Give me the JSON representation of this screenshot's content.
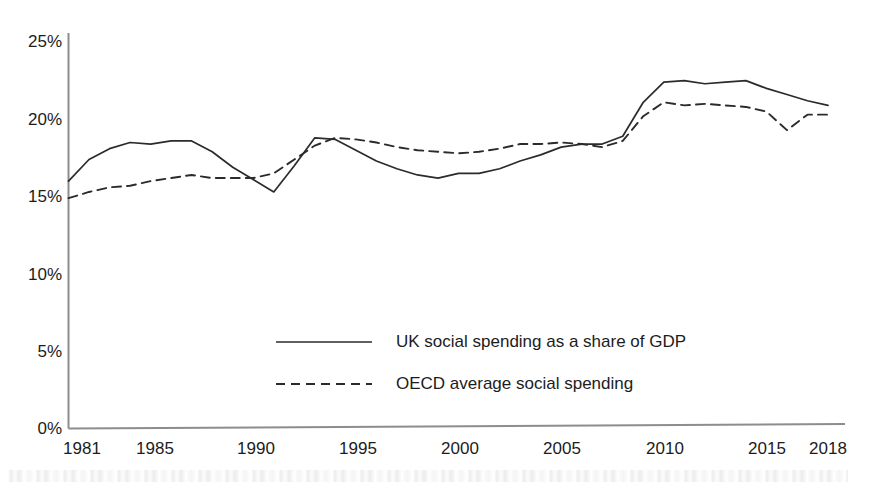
{
  "chart_data": {
    "type": "line",
    "title": "",
    "subtitle": "",
    "xlabel": "",
    "ylabel": "",
    "xlim": [
      1981,
      2018
    ],
    "ylim": [
      0,
      25
    ],
    "grid": false,
    "legend_position": "center",
    "y_ticks": [
      "0%",
      "5%",
      "10%",
      "15%",
      "20%",
      "25%"
    ],
    "y_tick_values": [
      0,
      5,
      10,
      15,
      20,
      25
    ],
    "x_ticks": [
      "1981",
      "1985",
      "1990",
      "1995",
      "2000",
      "2005",
      "2010",
      "2015",
      "2018"
    ],
    "x_tick_values": [
      1981,
      1985,
      1990,
      1995,
      2000,
      2005,
      2010,
      2015,
      2018
    ],
    "x": [
      1981,
      1982,
      1983,
      1984,
      1985,
      1986,
      1987,
      1988,
      1989,
      1990,
      1991,
      1992,
      1993,
      1994,
      1995,
      1996,
      1997,
      1998,
      1999,
      2000,
      2001,
      2002,
      2003,
      2004,
      2005,
      2006,
      2007,
      2008,
      2009,
      2010,
      2011,
      2012,
      2013,
      2014,
      2015,
      2016,
      2017,
      2018
    ],
    "series": [
      {
        "name": "UK social spending as a share of GDP",
        "style": "solid",
        "color": "#2b2b2b",
        "values": [
          16.0,
          17.4,
          18.1,
          18.5,
          18.4,
          18.6,
          18.6,
          17.9,
          16.9,
          16.1,
          15.3,
          17.0,
          18.8,
          18.7,
          18.0,
          17.3,
          16.8,
          16.4,
          16.2,
          16.5,
          16.5,
          16.8,
          17.3,
          17.7,
          18.2,
          18.4,
          18.4,
          18.9,
          21.1,
          22.4,
          22.5,
          22.3,
          22.4,
          22.5,
          22.0,
          21.6,
          21.2,
          20.9
        ]
      },
      {
        "name": "OECD average social spending",
        "style": "dashed",
        "color": "#2b2b2b",
        "values": [
          14.9,
          15.3,
          15.6,
          15.7,
          16.0,
          16.2,
          16.4,
          16.2,
          16.2,
          16.2,
          16.5,
          17.4,
          18.3,
          18.8,
          18.7,
          18.5,
          18.2,
          18.0,
          17.9,
          17.8,
          17.9,
          18.1,
          18.4,
          18.4,
          18.5,
          18.4,
          18.2,
          18.6,
          20.2,
          21.1,
          20.9,
          21.0,
          20.9,
          20.8,
          20.5,
          19.3,
          20.3,
          20.3
        ]
      }
    ]
  },
  "y_axis": {
    "labels": [
      {
        "text": "25%",
        "top": 33
      },
      {
        "text": "20%",
        "top": 111
      },
      {
        "text": "15%",
        "top": 188
      },
      {
        "text": "10%",
        "top": 266
      },
      {
        "text": "5%",
        "top": 343
      },
      {
        "text": "0%",
        "top": 420
      }
    ]
  },
  "x_axis": {
    "labels": [
      {
        "text": "1981",
        "left": 82
      },
      {
        "text": "1985",
        "left": 155
      },
      {
        "text": "1990",
        "left": 256
      },
      {
        "text": "1995",
        "left": 358
      },
      {
        "text": "2000",
        "left": 460
      },
      {
        "text": "2005",
        "left": 562
      },
      {
        "text": "2010",
        "left": 665
      },
      {
        "text": "2015",
        "left": 767
      },
      {
        "text": "2018",
        "left": 828
      }
    ]
  },
  "legend": {
    "items": [
      {
        "label": "UK social spending as a share of GDP",
        "style": "solid"
      },
      {
        "label": "OECD average social spending",
        "style": "dashed"
      }
    ]
  }
}
